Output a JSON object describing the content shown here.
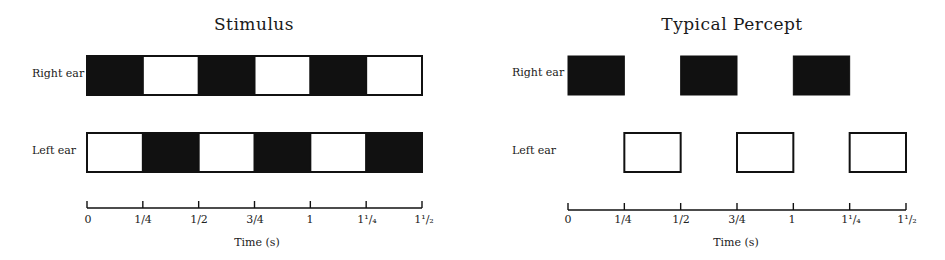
{
  "chart_data": [
    {
      "type": "diagram",
      "title": "Stimulus",
      "xlabel": "Time (s)",
      "x_range": [
        0,
        1.5
      ],
      "ticks": [
        0,
        0.25,
        0.5,
        0.75,
        1,
        1.25,
        1.5
      ],
      "tick_labels": [
        "0",
        "1/4",
        "1/2",
        "3/4",
        "1",
        "1¹/₄",
        "1¹/₂"
      ],
      "rows": [
        {
          "label": "Right ear",
          "segments": [
            {
              "start": 0,
              "end": 0.25,
              "fill": "black"
            },
            {
              "start": 0.25,
              "end": 0.5,
              "fill": "white"
            },
            {
              "start": 0.5,
              "end": 0.75,
              "fill": "black"
            },
            {
              "start": 0.75,
              "end": 1.0,
              "fill": "white"
            },
            {
              "start": 1.0,
              "end": 1.25,
              "fill": "black"
            },
            {
              "start": 1.25,
              "end": 1.5,
              "fill": "white"
            }
          ]
        },
        {
          "label": "Left ear",
          "segments": [
            {
              "start": 0,
              "end": 0.25,
              "fill": "white"
            },
            {
              "start": 0.25,
              "end": 0.5,
              "fill": "black"
            },
            {
              "start": 0.5,
              "end": 0.75,
              "fill": "white"
            },
            {
              "start": 0.75,
              "end": 1.0,
              "fill": "black"
            },
            {
              "start": 1.0,
              "end": 1.25,
              "fill": "white"
            },
            {
              "start": 1.25,
              "end": 1.5,
              "fill": "black"
            }
          ]
        }
      ]
    },
    {
      "type": "diagram",
      "title": "Typical Percept",
      "xlabel": "Time (s)",
      "x_range": [
        0,
        1.5
      ],
      "ticks": [
        0,
        0.25,
        0.5,
        0.75,
        1,
        1.25,
        1.5
      ],
      "tick_labels": [
        "0",
        "1/4",
        "1/2",
        "3/4",
        "1",
        "1¹/₄",
        "1¹/₂"
      ],
      "rows": [
        {
          "label": "Right ear",
          "segments": [
            {
              "start": 0,
              "end": 0.25,
              "fill": "black"
            },
            {
              "start": 0.5,
              "end": 0.75,
              "fill": "black"
            },
            {
              "start": 1.0,
              "end": 1.25,
              "fill": "black"
            }
          ]
        },
        {
          "label": "Left ear",
          "segments": [
            {
              "start": 0.25,
              "end": 0.5,
              "fill": "white"
            },
            {
              "start": 0.75,
              "end": 1.0,
              "fill": "white"
            },
            {
              "start": 1.25,
              "end": 1.5,
              "fill": "white"
            }
          ]
        }
      ]
    }
  ],
  "panels": {
    "stimulus": {
      "title": "Stimulus",
      "right_ear_label": "Right ear",
      "left_ear_label": "Left ear",
      "xlabel": "Time (s)",
      "tick_labels": [
        "0",
        "1/4",
        "1/2",
        "3/4",
        "1",
        "1¹/₄",
        "1¹/₂"
      ]
    },
    "percept": {
      "title": "Typical Percept",
      "right_ear_label": "Right ear",
      "left_ear_label": "Left ear",
      "xlabel": "Time (s)",
      "tick_labels": [
        "0",
        "1/4",
        "1/2",
        "3/4",
        "1",
        "1¹/₄",
        "1¹/₂"
      ]
    }
  },
  "colors": {
    "ink": "#111111",
    "background": "#ffffff"
  }
}
